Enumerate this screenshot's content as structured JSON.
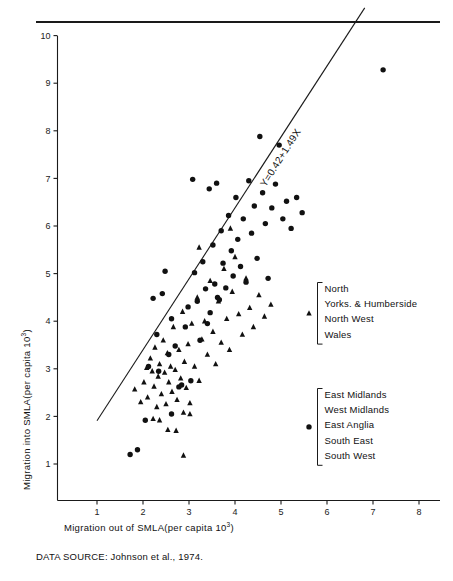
{
  "figure": {
    "source_note": "DATA SOURCE: Johnson et al., 1974.",
    "equation_label": "Y=0.42+1.49X"
  },
  "legend": {
    "groups": [
      {
        "marker": "triangle-marker",
        "marker_glyph": "▲",
        "items": [
          "North",
          "Yorks. & Humberside",
          "North West",
          "Wales"
        ]
      },
      {
        "marker": "circle-marker",
        "marker_glyph": "●",
        "items": [
          "East Midlands",
          "West Midlands",
          "East Anglia",
          "South East",
          "South West"
        ]
      }
    ]
  },
  "chart_data": {
    "type": "scatter",
    "title": "",
    "xlabel": "Migration out of SMLA(per capita 10",
    "xlabel_sup": "3",
    "xlabel_tail": ")",
    "ylabel": "Migration into SMLA(per capita 10",
    "ylabel_sup": "3",
    "ylabel_tail": ")",
    "xlim": [
      0.3,
      8.3
    ],
    "ylim": [
      0.55,
      10.4
    ],
    "xticks": [
      1,
      2,
      3,
      4,
      5,
      6,
      7,
      8
    ],
    "yticks": [
      1,
      2,
      3,
      4,
      5,
      6,
      7,
      8,
      9,
      10
    ],
    "grid": false,
    "legend_position": "right",
    "regression": {
      "intercept": 0.42,
      "slope": 1.49,
      "label": "Y=0.42+1.49X",
      "x_start": 1.0,
      "x_end": 6.82
    },
    "series": [
      {
        "name": "North / Yorks. & Humberside / North West / Wales",
        "marker": "triangle",
        "color": "#111111",
        "points": [
          [
            1.82,
            2.57
          ],
          [
            1.95,
            2.3
          ],
          [
            2.02,
            2.72
          ],
          [
            2.08,
            3.02
          ],
          [
            2.1,
            2.4
          ],
          [
            2.16,
            3.22
          ],
          [
            2.2,
            2.95
          ],
          [
            2.24,
            2.63
          ],
          [
            2.26,
            3.45
          ],
          [
            2.3,
            2.2
          ],
          [
            2.33,
            2.84
          ],
          [
            2.36,
            3.1
          ],
          [
            2.4,
            2.47
          ],
          [
            2.44,
            3.6
          ],
          [
            2.47,
            2.92
          ],
          [
            2.5,
            2.26
          ],
          [
            2.53,
            3.33
          ],
          [
            2.56,
            2.72
          ],
          [
            2.6,
            3.05
          ],
          [
            2.63,
            2.52
          ],
          [
            2.66,
            3.88
          ],
          [
            2.7,
            2.98
          ],
          [
            2.74,
            2.35
          ],
          [
            2.78,
            3.4
          ],
          [
            2.82,
            2.8
          ],
          [
            2.86,
            4.2
          ],
          [
            2.9,
            3.15
          ],
          [
            2.94,
            2.6
          ],
          [
            2.98,
            3.52
          ],
          [
            3.02,
            2.28
          ],
          [
            3.06,
            3.95
          ],
          [
            3.12,
            3.05
          ],
          [
            3.18,
            4.5
          ],
          [
            3.22,
            2.75
          ],
          [
            3.28,
            3.62
          ],
          [
            3.34,
            4.0
          ],
          [
            3.4,
            3.3
          ],
          [
            3.46,
            4.85
          ],
          [
            3.52,
            3.78
          ],
          [
            3.58,
            3.1
          ],
          [
            3.64,
            4.42
          ],
          [
            3.7,
            3.55
          ],
          [
            3.76,
            5.1
          ],
          [
            3.82,
            4.05
          ],
          [
            3.88,
            3.4
          ],
          [
            3.94,
            4.62
          ],
          [
            4.0,
            5.35
          ],
          [
            4.08,
            4.15
          ],
          [
            4.16,
            3.72
          ],
          [
            4.24,
            4.9
          ],
          [
            4.32,
            4.28
          ],
          [
            4.4,
            3.88
          ],
          [
            4.52,
            4.55
          ],
          [
            4.64,
            4.1
          ],
          [
            4.78,
            4.35
          ],
          [
            2.88,
            1.18
          ],
          [
            2.54,
            1.72
          ],
          [
            2.72,
            1.7
          ],
          [
            2.36,
            1.92
          ],
          [
            2.22,
            1.95
          ],
          [
            3.02,
            2.05
          ],
          [
            2.88,
            2.08
          ],
          [
            3.22,
            5.55
          ],
          [
            3.9,
            5.95
          ]
        ]
      },
      {
        "name": "East Midlands / West Midlands / East Anglia / South East / South West",
        "marker": "circle",
        "color": "#111111",
        "points": [
          [
            1.72,
            1.2
          ],
          [
            1.88,
            1.3
          ],
          [
            2.05,
            1.92
          ],
          [
            2.3,
            3.72
          ],
          [
            2.42,
            4.58
          ],
          [
            2.56,
            3.3
          ],
          [
            2.62,
            4.05
          ],
          [
            2.7,
            3.48
          ],
          [
            2.78,
            2.62
          ],
          [
            2.84,
            2.66
          ],
          [
            2.92,
            3.88
          ],
          [
            2.98,
            4.3
          ],
          [
            3.04,
            2.75
          ],
          [
            3.12,
            5.02
          ],
          [
            3.18,
            4.42
          ],
          [
            3.24,
            3.6
          ],
          [
            3.3,
            5.25
          ],
          [
            3.36,
            4.68
          ],
          [
            3.4,
            3.95
          ],
          [
            3.46,
            4.18
          ],
          [
            3.52,
            5.6
          ],
          [
            3.56,
            4.78
          ],
          [
            3.62,
            4.5
          ],
          [
            3.66,
            4.45
          ],
          [
            3.7,
            5.9
          ],
          [
            3.74,
            5.22
          ],
          [
            3.8,
            4.7
          ],
          [
            3.86,
            6.22
          ],
          [
            3.92,
            5.48
          ],
          [
            3.96,
            4.95
          ],
          [
            4.02,
            6.6
          ],
          [
            4.06,
            5.72
          ],
          [
            4.12,
            5.15
          ],
          [
            4.18,
            6.15
          ],
          [
            4.24,
            4.82
          ],
          [
            4.3,
            6.95
          ],
          [
            4.36,
            5.85
          ],
          [
            4.42,
            6.42
          ],
          [
            4.48,
            5.32
          ],
          [
            4.54,
            7.88
          ],
          [
            4.6,
            6.7
          ],
          [
            4.66,
            6.05
          ],
          [
            4.72,
            4.9
          ],
          [
            4.8,
            6.38
          ],
          [
            4.88,
            6.88
          ],
          [
            4.96,
            7.7
          ],
          [
            5.04,
            6.15
          ],
          [
            5.12,
            6.52
          ],
          [
            5.22,
            5.95
          ],
          [
            5.34,
            6.6
          ],
          [
            5.46,
            6.28
          ],
          [
            7.22,
            9.28
          ],
          [
            2.22,
            4.48
          ],
          [
            2.48,
            5.05
          ],
          [
            3.08,
            6.98
          ],
          [
            3.44,
            6.78
          ],
          [
            3.6,
            6.9
          ],
          [
            2.34,
            2.95
          ],
          [
            2.62,
            2.05
          ],
          [
            2.12,
            3.05
          ]
        ]
      }
    ]
  }
}
